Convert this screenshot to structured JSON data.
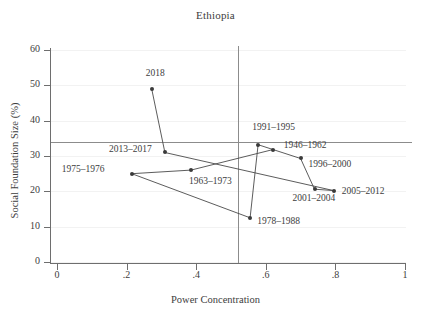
{
  "chart_data": {
    "type": "scatter",
    "title": "Ethiopia",
    "xlabel": "Power Concentration",
    "ylabel": "Social Foundation Size (%)",
    "xlim": [
      0,
      1
    ],
    "ylim": [
      0,
      62
    ],
    "grid": true,
    "legend": "none",
    "xticks": [
      "0",
      ".2",
      ".4",
      ".6",
      ".8",
      "1"
    ],
    "xtickvals": [
      0,
      0.2,
      0.4,
      0.6,
      0.8,
      1
    ],
    "yticks": [
      "0",
      "10",
      "20",
      "30",
      "40",
      "50",
      "60"
    ],
    "ytickvals": [
      0,
      10,
      20,
      30,
      40,
      50,
      60
    ],
    "reference_lines": {
      "vertical_x": 0.52,
      "horizontal_y": 34
    },
    "connected": true,
    "points": [
      {
        "label": "1946–1962",
        "x": 0.62,
        "y": 31.8,
        "lx": 11,
        "ly": -4
      },
      {
        "label": "1963–1973",
        "x": 0.385,
        "y": 26.0,
        "lx": -2,
        "ly": 12
      },
      {
        "label": "1975–1976",
        "x": 0.215,
        "y": 25.0,
        "lx": -70,
        "ly": -4
      },
      {
        "label": "1978–1988",
        "x": 0.555,
        "y": 12.5,
        "lx": 7,
        "ly": 4
      },
      {
        "label": "1991–1995",
        "x": 0.578,
        "y": 33.2,
        "lx": -6,
        "ly": -17
      },
      {
        "label": "1996–2000",
        "x": 0.7,
        "y": 29.3,
        "lx": 8,
        "ly": 7
      },
      {
        "label": "2001–2004",
        "x": 0.74,
        "y": 20.6,
        "lx": -22,
        "ly": 10
      },
      {
        "label": "2005–2012",
        "x": 0.795,
        "y": 20.2,
        "lx": 8,
        "ly": 1
      },
      {
        "label": "2013–2017",
        "x": 0.31,
        "y": 31.0,
        "lx": -56,
        "ly": -2
      },
      {
        "label": "2018",
        "x": 0.272,
        "y": 49.0,
        "lx": -6,
        "ly": -15
      }
    ],
    "path_order": [
      "1946–1962",
      "1963–1973",
      "1975–1976",
      "1978–1988",
      "1991–1995",
      "1996–2000",
      "2001–2004",
      "2005–2012",
      "2013–2017",
      "2018"
    ],
    "series_color": "#4a4a4a",
    "marker_color": "#3a3a3a",
    "reference_color": "#8c8c8c"
  }
}
